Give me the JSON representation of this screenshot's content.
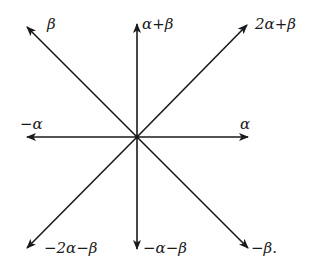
{
  "center": {
    "x": 137,
    "y": 137
  },
  "colors": {
    "line": "#1a1a1a",
    "background": "#ffffff"
  },
  "roots": [
    {
      "id": "beta",
      "label": "β",
      "tip": {
        "x": 27,
        "y": 27
      },
      "label_pos": {
        "x": 47,
        "y": 16
      }
    },
    {
      "id": "alpha-plus-beta",
      "label": "α+β",
      "tip": {
        "x": 137,
        "y": 24
      },
      "label_pos": {
        "x": 142,
        "y": 16
      }
    },
    {
      "id": "2alpha-plus-beta",
      "label": "2α+β",
      "tip": {
        "x": 247,
        "y": 25
      },
      "label_pos": {
        "x": 255,
        "y": 16
      }
    },
    {
      "id": "minus-alpha",
      "label": "−α",
      "tip": {
        "x": 27,
        "y": 137
      },
      "label_pos": {
        "x": 20,
        "y": 116
      }
    },
    {
      "id": "alpha",
      "label": "α",
      "tip": {
        "x": 248,
        "y": 137
      },
      "label_pos": {
        "x": 240,
        "y": 116
      }
    },
    {
      "id": "minus-2alpha-minus-beta",
      "label": "−2α−β",
      "tip": {
        "x": 27,
        "y": 248
      },
      "label_pos": {
        "x": 44,
        "y": 240
      }
    },
    {
      "id": "minus-alpha-minus-beta",
      "label": "−α−β",
      "tip": {
        "x": 137,
        "y": 249
      },
      "label_pos": {
        "x": 143,
        "y": 240
      }
    },
    {
      "id": "minus-beta",
      "label": "−β.",
      "tip": {
        "x": 248,
        "y": 248
      },
      "label_pos": {
        "x": 251,
        "y": 240
      }
    }
  ]
}
